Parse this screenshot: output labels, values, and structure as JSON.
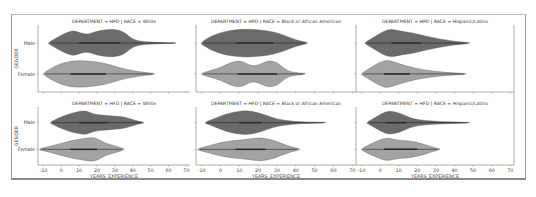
{
  "figure": {
    "type": "facet-grid-violin",
    "colors": {
      "male": "#6b6b6b",
      "female": "#a3a3a3",
      "outline": "#555555",
      "spine": "#777777"
    }
  },
  "chart_data": [
    {
      "type": "violin",
      "title": "DEPARTMENT = HPD | RACE = White",
      "xlabel": "YEARS_EXPERIENCE",
      "ylabel": "GENDER",
      "categories": [
        "Male",
        "Female"
      ],
      "xticks": [
        -10,
        0,
        10,
        20,
        30,
        40,
        50,
        60,
        70
      ],
      "xlim": [
        -13,
        72
      ],
      "series": [
        {
          "name": "Male",
          "range": [
            -7,
            64
          ],
          "iqr": [
            10,
            33
          ],
          "density": [
            [
              -7,
              0.05
            ],
            [
              -3,
              0.35
            ],
            [
              2,
              0.7
            ],
            [
              7,
              0.92
            ],
            [
              11,
              0.7
            ],
            [
              15,
              0.62
            ],
            [
              20,
              0.85
            ],
            [
              26,
              0.98
            ],
            [
              32,
              0.95
            ],
            [
              36,
              0.7
            ],
            [
              40,
              0.25
            ],
            [
              46,
              0.1
            ],
            [
              55,
              0.04
            ],
            [
              64,
              0.02
            ]
          ]
        },
        {
          "name": "Female",
          "range": [
            -10,
            52
          ],
          "iqr": [
            5,
            25
          ],
          "density": [
            [
              -10,
              0.05
            ],
            [
              -5,
              0.45
            ],
            [
              0,
              0.75
            ],
            [
              6,
              0.92
            ],
            [
              12,
              0.95
            ],
            [
              20,
              0.85
            ],
            [
              26,
              0.7
            ],
            [
              32,
              0.45
            ],
            [
              40,
              0.22
            ],
            [
              48,
              0.08
            ],
            [
              52,
              0.03
            ]
          ]
        }
      ]
    },
    {
      "type": "violin",
      "title": "DEPARTMENT = HPD | RACE = Black or African American",
      "xlabel": "",
      "ylabel": "",
      "categories": [
        "Male",
        "Female"
      ],
      "xticks": [
        -10,
        0,
        10,
        20,
        30,
        40,
        50,
        60,
        70
      ],
      "xlim": [
        -13,
        72
      ],
      "series": [
        {
          "name": "Male",
          "range": [
            -10,
            46
          ],
          "iqr": [
            8,
            28
          ],
          "density": [
            [
              -10,
              0.08
            ],
            [
              -5,
              0.5
            ],
            [
              2,
              0.82
            ],
            [
              8,
              0.95
            ],
            [
              15,
              1.0
            ],
            [
              22,
              0.92
            ],
            [
              28,
              0.8
            ],
            [
              34,
              0.55
            ],
            [
              40,
              0.22
            ],
            [
              46,
              0.05
            ]
          ]
        },
        {
          "name": "Female",
          "range": [
            -10,
            45
          ],
          "iqr": [
            9,
            30
          ],
          "density": [
            [
              -10,
              0.05
            ],
            [
              -6,
              0.2
            ],
            [
              0,
              0.45
            ],
            [
              6,
              0.85
            ],
            [
              11,
              0.95
            ],
            [
              16,
              0.55
            ],
            [
              20,
              0.6
            ],
            [
              25,
              0.95
            ],
            [
              30,
              0.85
            ],
            [
              34,
              0.35
            ],
            [
              38,
              0.1
            ],
            [
              45,
              0.04
            ]
          ]
        }
      ]
    },
    {
      "type": "violin",
      "title": "DEPARTMENT = HPD | RACE = Hispanic/Latino",
      "xlabel": "",
      "ylabel": "",
      "categories": [
        "Male",
        "Female"
      ],
      "xticks": [
        -10,
        0,
        10,
        20,
        30,
        40,
        50,
        60,
        70
      ],
      "xlim": [
        -13,
        72
      ],
      "series": [
        {
          "name": "Male",
          "range": [
            -8,
            48
          ],
          "iqr": [
            6,
            22
          ],
          "density": [
            [
              -8,
              0.05
            ],
            [
              -3,
              0.45
            ],
            [
              2,
              0.85
            ],
            [
              6,
              1.0
            ],
            [
              12,
              0.82
            ],
            [
              18,
              0.72
            ],
            [
              24,
              0.5
            ],
            [
              32,
              0.3
            ],
            [
              40,
              0.12
            ],
            [
              48,
              0.03
            ]
          ]
        },
        {
          "name": "Female",
          "range": [
            -10,
            46
          ],
          "iqr": [
            2,
            16
          ],
          "density": [
            [
              -10,
              0.05
            ],
            [
              -5,
              0.45
            ],
            [
              0,
              0.85
            ],
            [
              4,
              1.0
            ],
            [
              10,
              0.72
            ],
            [
              16,
              0.5
            ],
            [
              22,
              0.32
            ],
            [
              30,
              0.18
            ],
            [
              38,
              0.08
            ],
            [
              46,
              0.03
            ]
          ]
        }
      ]
    },
    {
      "type": "violin",
      "title": "DEPARTMENT = HFD | RACE = White",
      "xlabel": "YEARS_EXPERIENCE",
      "ylabel": "GENDER",
      "categories": [
        "Male",
        "Female"
      ],
      "xticks": [
        -10,
        0,
        10,
        20,
        30,
        40,
        50,
        60,
        70
      ],
      "xlim": [
        -13,
        72
      ],
      "series": [
        {
          "name": "Male",
          "range": [
            -6,
            46
          ],
          "iqr": [
            10,
            26
          ],
          "density": [
            [
              -6,
              0.05
            ],
            [
              -2,
              0.35
            ],
            [
              4,
              0.7
            ],
            [
              10,
              0.92
            ],
            [
              14,
              0.98
            ],
            [
              18,
              0.7
            ],
            [
              24,
              0.6
            ],
            [
              30,
              0.55
            ],
            [
              36,
              0.45
            ],
            [
              42,
              0.15
            ],
            [
              46,
              0.04
            ]
          ]
        },
        {
          "name": "Female",
          "range": [
            -12,
            35
          ],
          "iqr": [
            5,
            20
          ],
          "density": [
            [
              -12,
              0.05
            ],
            [
              -6,
              0.25
            ],
            [
              0,
              0.5
            ],
            [
              6,
              0.72
            ],
            [
              12,
              0.88
            ],
            [
              17,
              0.98
            ],
            [
              20,
              0.9
            ],
            [
              24,
              0.55
            ],
            [
              28,
              0.35
            ],
            [
              32,
              0.2
            ],
            [
              35,
              0.04
            ]
          ]
        }
      ]
    },
    {
      "type": "violin",
      "title": "DEPARTMENT = HFD | RACE = Black or African American",
      "xlabel": "YEARS_EXPERIENCE",
      "ylabel": "",
      "categories": [
        "Male",
        "Female"
      ],
      "xticks": [
        -10,
        0,
        10,
        20,
        30,
        40,
        50,
        60,
        70
      ],
      "xlim": [
        -13,
        72
      ],
      "series": [
        {
          "name": "Male",
          "range": [
            -8,
            56
          ],
          "iqr": [
            10,
            22
          ],
          "density": [
            [
              -8,
              0.05
            ],
            [
              -3,
              0.35
            ],
            [
              3,
              0.72
            ],
            [
              9,
              0.92
            ],
            [
              14,
              1.0
            ],
            [
              20,
              0.82
            ],
            [
              25,
              0.55
            ],
            [
              30,
              0.3
            ],
            [
              36,
              0.15
            ],
            [
              44,
              0.06
            ],
            [
              56,
              0.02
            ]
          ]
        },
        {
          "name": "Female",
          "range": [
            -12,
            42
          ],
          "iqr": [
            8,
            24
          ],
          "density": [
            [
              -12,
              0.05
            ],
            [
              -6,
              0.3
            ],
            [
              0,
              0.55
            ],
            [
              6,
              0.7
            ],
            [
              12,
              0.78
            ],
            [
              18,
              0.9
            ],
            [
              22,
              0.95
            ],
            [
              28,
              0.75
            ],
            [
              33,
              0.45
            ],
            [
              38,
              0.18
            ],
            [
              42,
              0.04
            ]
          ]
        }
      ]
    },
    {
      "type": "violin",
      "title": "DEPARTMENT = HFD | RACE = Hispanic/Latino",
      "xlabel": "YEARS_EXPERIENCE",
      "ylabel": "",
      "categories": [
        "Male",
        "Female"
      ],
      "xticks": [
        -10,
        0,
        10,
        20,
        30,
        40,
        50,
        60,
        70
      ],
      "xlim": [
        -13,
        72
      ],
      "series": [
        {
          "name": "Male",
          "range": [
            -7,
            48
          ],
          "iqr": [
            3,
            14
          ],
          "density": [
            [
              -7,
              0.05
            ],
            [
              -3,
              0.4
            ],
            [
              1,
              0.75
            ],
            [
              5,
              0.98
            ],
            [
              10,
              0.8
            ],
            [
              14,
              0.55
            ],
            [
              18,
              0.3
            ],
            [
              24,
              0.18
            ],
            [
              32,
              0.1
            ],
            [
              40,
              0.06
            ],
            [
              48,
              0.02
            ]
          ]
        },
        {
          "name": "Female",
          "range": [
            -10,
            32
          ],
          "iqr": [
            2,
            20
          ],
          "density": [
            [
              -10,
              0.05
            ],
            [
              -5,
              0.45
            ],
            [
              0,
              0.78
            ],
            [
              4,
              0.95
            ],
            [
              9,
              0.75
            ],
            [
              14,
              0.72
            ],
            [
              19,
              0.6
            ],
            [
              24,
              0.4
            ],
            [
              28,
              0.2
            ],
            [
              32,
              0.04
            ]
          ]
        }
      ]
    }
  ]
}
